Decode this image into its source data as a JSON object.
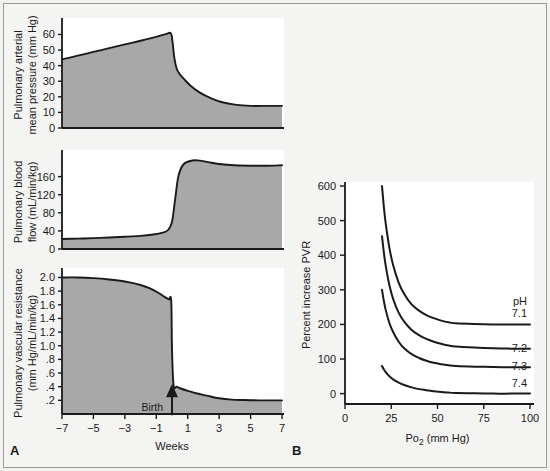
{
  "figure": {
    "background_color": "#f4f4f2",
    "border_color": "#9a9a96",
    "fill_color": "#a8a8a8",
    "line_color": "#1a1a1a",
    "panel_a_letter": "A",
    "panel_b_letter": "B"
  },
  "chart_data": [
    {
      "type": "area",
      "id": "pulmonary-arterial-mean-pressure",
      "panel": "A",
      "title": "",
      "ylabel": "Pulmonary arterial\nmean pressure (mm Hg)",
      "ylabel_line1": "Pulmonary arterial",
      "ylabel_line2": "mean pressure (mm Hg)",
      "xlabel": "",
      "xlim": [
        -7,
        7
      ],
      "ylim": [
        0,
        68
      ],
      "yticks": [
        0,
        10,
        20,
        30,
        40,
        50,
        60
      ],
      "ytick_labels": [
        "0",
        "10",
        "20",
        "30",
        "40",
        "50",
        "60"
      ],
      "xticks": [
        -7,
        -5,
        -3,
        -1,
        1,
        3,
        5,
        7
      ],
      "xtick_labels": [],
      "grid": false,
      "x": [
        -7,
        -6,
        -5,
        -4,
        -3,
        -2,
        -1,
        -0.4,
        -0.1,
        0,
        0.15,
        0.3,
        0.5,
        0.8,
        1.2,
        1.8,
        2.5,
        3.2,
        4,
        5,
        6,
        7
      ],
      "values": [
        44,
        46.4,
        48.8,
        51.2,
        53.6,
        56,
        58.5,
        60.2,
        61,
        58,
        45,
        38,
        34.5,
        31,
        27,
        22.5,
        19,
        16.5,
        15,
        14.2,
        14.2,
        14.2
      ]
    },
    {
      "type": "area",
      "id": "pulmonary-blood-flow",
      "panel": "A",
      "title": "",
      "ylabel": "Pulmonary blood\nflow (mL/min/kg)",
      "ylabel_line1": "Pulmonary blood",
      "ylabel_line2": "flow (mL/min/kg)",
      "xlabel": "",
      "xlim": [
        -7,
        7
      ],
      "ylim": [
        0,
        210
      ],
      "yticks": [
        0,
        40,
        80,
        120,
        160
      ],
      "ytick_labels": [
        "0",
        "40",
        "80",
        "120",
        "160"
      ],
      "xticks": [
        -7,
        -5,
        -3,
        -1,
        1,
        3,
        5,
        7
      ],
      "xtick_labels": [],
      "grid": false,
      "x": [
        -7,
        -6,
        -5,
        -4,
        -3,
        -2,
        -1.2,
        -0.6,
        -0.25,
        0,
        0.2,
        0.4,
        0.7,
        1.1,
        1.6,
        2.3,
        3,
        4,
        5,
        6,
        7
      ],
      "values": [
        22,
        23,
        24,
        25.5,
        27,
        29,
        32,
        36,
        42,
        60,
        110,
        160,
        186,
        194,
        196,
        192,
        188,
        185,
        184,
        184,
        185
      ]
    },
    {
      "type": "area",
      "id": "pulmonary-vascular-resistance",
      "panel": "A",
      "title": "",
      "ylabel": "Pulmonary vascular resistance\n(mm Hg/mL/min/kg)",
      "ylabel_line1": "Pulmonary vascular resistance",
      "ylabel_line2": "(mm Hg/mL/min/kg)",
      "xlabel": "Weeks",
      "xlim": [
        -7,
        7
      ],
      "ylim": [
        0,
        2.08
      ],
      "yticks": [
        0.2,
        0.4,
        0.6,
        0.8,
        1.0,
        1.2,
        1.4,
        1.6,
        1.8,
        2.0
      ],
      "ytick_labels": [
        ".2",
        ".4",
        ".6",
        ".8",
        "1.0",
        "1.2",
        "1.4",
        "1.6",
        "1.8",
        "2.0"
      ],
      "xticks": [
        -7,
        -5,
        -3,
        -1,
        1,
        3,
        5,
        7
      ],
      "xtick_labels": [
        "-7",
        "-5",
        "-3",
        "-1",
        "1",
        "3",
        "5",
        "7"
      ],
      "grid": false,
      "annotation": "Birth",
      "annotation_x": 0,
      "annotation_y": 0.42,
      "x": [
        -7,
        -6,
        -5,
        -4,
        -3,
        -2,
        -1.4,
        -0.9,
        -0.5,
        -0.2,
        -0.05,
        0,
        0.1,
        0.3,
        0.6,
        1,
        1.6,
        2.2,
        3,
        3.8,
        4.6,
        5.5,
        6.2,
        7
      ],
      "values": [
        2.0,
        2.0,
        1.99,
        1.97,
        1.94,
        1.89,
        1.84,
        1.78,
        1.72,
        1.68,
        1.66,
        0.95,
        0.42,
        0.4,
        0.37,
        0.34,
        0.3,
        0.27,
        0.23,
        0.21,
        0.205,
        0.2,
        0.2,
        0.2
      ]
    },
    {
      "type": "line",
      "id": "percent-increase-pvr-vs-po2",
      "panel": "B",
      "title": "",
      "ylabel": "Percent increase PVR",
      "xlabel": "Po2 (mm Hg)",
      "xlabel_main": "Po",
      "xlabel_sub": "2",
      "xlabel_unit": " (mm Hg)",
      "xlim": [
        0,
        100
      ],
      "ylim": [
        -30,
        600
      ],
      "yticks": [
        0,
        100,
        200,
        300,
        400,
        500,
        600
      ],
      "ytick_labels": [
        "0",
        "100",
        "200",
        "300",
        "400",
        "500",
        "600"
      ],
      "xticks": [
        0,
        25,
        50,
        75,
        100
      ],
      "xtick_labels": [
        "0",
        "25",
        "50",
        "75",
        "100"
      ],
      "grid": false,
      "legend_title": "pH",
      "legend_position": "right-inside",
      "series": [
        {
          "name": "7.1",
          "label": "7.1",
          "x": [
            20,
            21,
            22,
            24,
            26,
            29,
            32,
            36,
            40,
            44,
            48,
            52,
            56,
            60,
            70,
            80,
            90,
            100
          ],
          "values": [
            600,
            540,
            492,
            421,
            372,
            321,
            288,
            258,
            240,
            227,
            218,
            211,
            206,
            203,
            201,
            200,
            200,
            200
          ]
        },
        {
          "name": "7.2",
          "label": "7.2",
          "x": [
            20,
            21,
            22,
            24,
            26,
            29,
            32,
            36,
            40,
            44,
            48,
            52,
            56,
            60,
            70,
            80,
            90,
            100
          ],
          "values": [
            455,
            408,
            370,
            313,
            274,
            234,
            208,
            184,
            169,
            158,
            150,
            144,
            139,
            136,
            133,
            131,
            130,
            130
          ]
        },
        {
          "name": "7.3",
          "label": "7.3",
          "x": [
            20,
            21,
            22,
            24,
            26,
            29,
            32,
            36,
            40,
            44,
            48,
            52,
            56,
            60,
            70,
            80,
            90,
            100
          ],
          "values": [
            300,
            268,
            242,
            204,
            178,
            150,
            131,
            114,
            103,
            95,
            89,
            85,
            82,
            80,
            78,
            77,
            76,
            76
          ]
        },
        {
          "name": "7.4",
          "label": "7.4",
          "x": [
            20,
            21,
            22,
            24,
            26,
            29,
            32,
            36,
            40,
            44,
            48,
            52,
            56,
            60,
            70,
            80,
            90,
            100
          ],
          "values": [
            80,
            70,
            62,
            50,
            41,
            32,
            25,
            18,
            13,
            10,
            7,
            5,
            3,
            2,
            1,
            0,
            0,
            0
          ]
        }
      ]
    }
  ]
}
